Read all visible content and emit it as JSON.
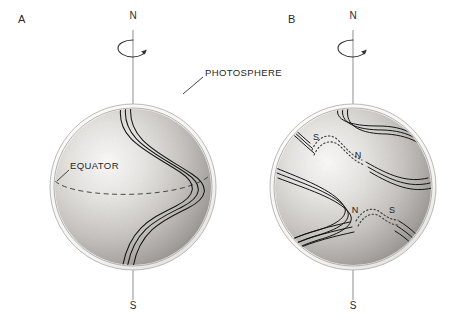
{
  "figure": {
    "panels": [
      {
        "letter": "A",
        "letter_pos": {
          "x": 18,
          "y": 13
        },
        "sphere": {
          "cx": 133,
          "cy": 187,
          "r": 79,
          "rim_r": 83
        },
        "north_label": "N",
        "north_label_pos": {
          "x": 126,
          "y": 11
        },
        "south_label": "S",
        "south_label_pos": {
          "x": 126,
          "y": 304
        },
        "axis_top_y": 30,
        "axis_bottom_y": 318,
        "rotation_arrow": {
          "cx": 133,
          "cy": 48,
          "rx": 14,
          "ry": 8
        },
        "annotations": [
          {
            "name": "photosphere",
            "text": "PHOTOSPHERE",
            "x": 205,
            "y": 68,
            "leader": {
              "x1": 203,
              "y1": 78,
              "x2": 186,
              "y2": 92
            }
          },
          {
            "name": "equator",
            "text": "EQUATOR",
            "x": 70,
            "y": 161,
            "leader": {
              "x1": 68,
              "y1": 171,
              "x2": 56,
              "y2": 181
            }
          }
        ],
        "equator_dashed": true,
        "field_line_bundles": 1,
        "caption_concept": "Magnetic field line bundle wound by differential rotation"
      },
      {
        "letter": "B",
        "letter_pos": {
          "x": 288,
          "y": 13
        },
        "sphere": {
          "cx": 353,
          "cy": 187,
          "r": 79,
          "rim_r": 83
        },
        "north_label": "N",
        "north_label_pos": {
          "x": 346,
          "y": 11
        },
        "south_label": "S",
        "south_label_pos": {
          "x": 346,
          "y": 304
        },
        "axis_top_y": 30,
        "axis_bottom_y": 318,
        "rotation_arrow": {
          "cx": 353,
          "cy": 48,
          "rx": 14,
          "ry": 8
        },
        "sunspot_pairs": [
          {
            "name": "upper-sunspot-pair",
            "left": {
              "label": "S",
              "x": 316,
              "y": 137
            },
            "right": {
              "label": "N",
              "x": 358,
              "y": 155
            }
          },
          {
            "name": "lower-sunspot-pair",
            "left": {
              "label": "N",
              "x": 355,
              "y": 210
            },
            "right": {
              "label": "S",
              "x": 392,
              "y": 210
            }
          }
        ],
        "eruption_points": [
          {
            "name": "upper-left-limb-eruption",
            "x": 274,
            "y": 110
          },
          {
            "name": "lower-right-limb-eruption",
            "x": 430,
            "y": 249
          }
        ],
        "field_line_bundles": 3,
        "caption_concept": "Field lines further wound, erupting through photosphere as bipolar sunspot groups"
      }
    ],
    "colors": {
      "ink": "#2b2b2b",
      "field_line": "#1a1a1a",
      "sphere_light": "#f2f0ee",
      "sphere_mid": "#c9c6c2",
      "sphere_dark": "#8c8a87",
      "rim": "#b9b6b2",
      "background": "#ffffff"
    }
  }
}
